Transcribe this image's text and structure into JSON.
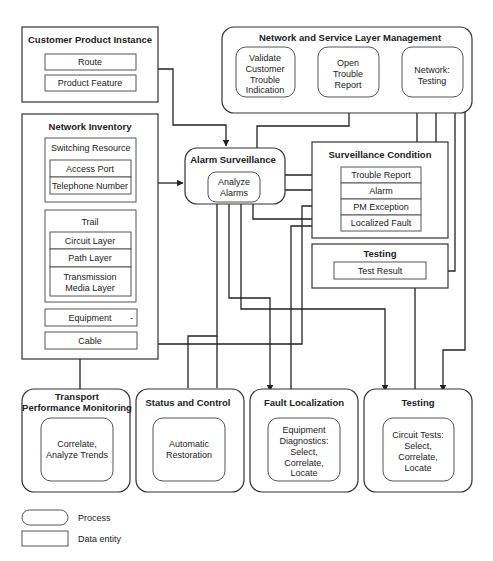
{
  "customer_product_instance": {
    "title": "Customer Product Instance",
    "items": [
      "Route",
      "Product Feature"
    ]
  },
  "network_inventory": {
    "title": "Network Inventory",
    "switching_resource": {
      "title": "Switching Resource",
      "items": [
        "Access Port",
        "Telephone Number"
      ]
    },
    "trail": {
      "title": "Trail",
      "items": [
        "Circuit Layer",
        "Path Layer",
        "Transmission",
        "Media Layer"
      ]
    },
    "equipment": "Equipment",
    "equipment_mark": "-",
    "cable": "Cable"
  },
  "network_service_layer_mgmt": {
    "title": "Network and Service Layer Management",
    "processes": [
      {
        "lines": [
          "Validate",
          "Customer",
          "Trouble",
          "Indication"
        ]
      },
      {
        "lines": [
          "Open",
          "Trouble",
          "Report"
        ]
      },
      {
        "lines": [
          "Network:",
          "Testing"
        ]
      }
    ]
  },
  "alarm_surveillance": {
    "title": "Alarm Surveillance",
    "process": [
      "Analyze",
      "Alarms"
    ]
  },
  "surveillance_condition": {
    "title": "Surveillance Condition",
    "items": [
      "Trouble Report",
      "Alarm",
      "PM Exception",
      "Localized Fault"
    ]
  },
  "testing_data": {
    "title": "Testing",
    "item": "Test Result"
  },
  "bottom_processes": [
    {
      "title_lines": [
        "Transport",
        "Performance Monitoring"
      ],
      "inner": [
        "Correlate,",
        "Analyze Trends"
      ]
    },
    {
      "title_lines": [
        "Status and Control"
      ],
      "inner": [
        "Automatic",
        "Restoration"
      ]
    },
    {
      "title_lines": [
        "Fault Localization"
      ],
      "inner": [
        "Equipment",
        "Diagnostics:",
        "Select,",
        "Correlate,",
        "Locate"
      ]
    },
    {
      "title_lines": [
        "Testing"
      ],
      "inner": [
        "Circuit Tests:",
        "Select,",
        "Correlate,",
        "Locate"
      ]
    }
  ],
  "legend": {
    "process": "Process",
    "data_entity": "Data entity"
  }
}
